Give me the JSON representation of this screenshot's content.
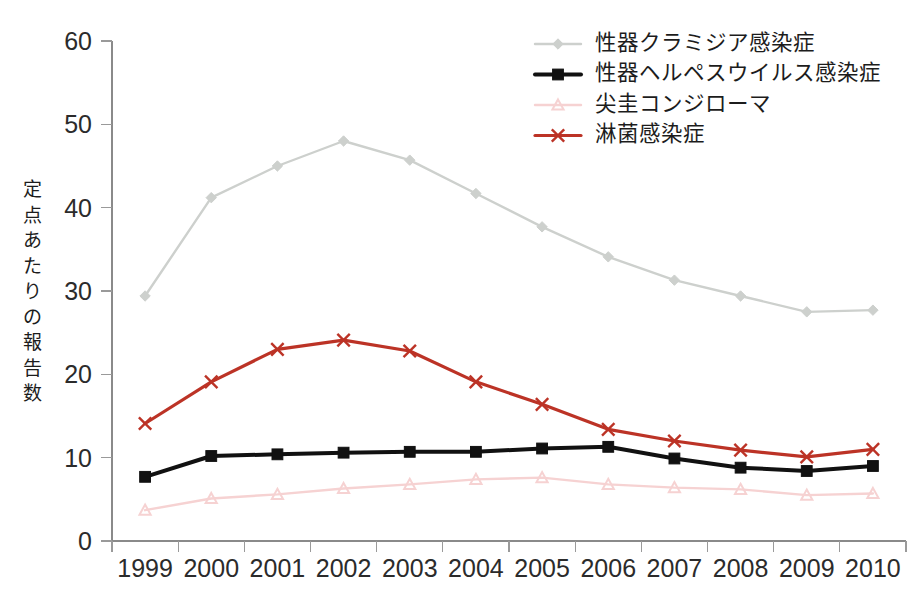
{
  "chart_data": {
    "type": "line",
    "title": "",
    "xlabel": "",
    "ylabel": "定点あたりの報告数",
    "categories": [
      "1999",
      "2000",
      "2001",
      "2002",
      "2003",
      "2004",
      "2005",
      "2006",
      "2007",
      "2008",
      "2009",
      "2010"
    ],
    "ylim": [
      0,
      60
    ],
    "y_ticks": [
      "0",
      "10",
      "20",
      "30",
      "40",
      "50",
      "60"
    ],
    "grid": false,
    "legend_position": "top-right",
    "series": [
      {
        "name": "性器クラミジア感染症",
        "color": "#cdd0cd",
        "marker": "diamond",
        "values": [
          29.4,
          41.2,
          45.0,
          48.0,
          45.7,
          41.7,
          37.7,
          34.1,
          31.3,
          29.4,
          27.5,
          27.7
        ]
      },
      {
        "name": "性器ヘルペスウイルス感染症",
        "color": "#111111",
        "marker": "square",
        "values": [
          7.7,
          10.2,
          10.4,
          10.6,
          10.7,
          10.7,
          11.1,
          11.3,
          9.9,
          8.8,
          8.4,
          9.0
        ]
      },
      {
        "name": "尖圭コンジローマ",
        "color": "#f6d2d2",
        "marker": "triangle",
        "values": [
          3.7,
          5.1,
          5.6,
          6.3,
          6.8,
          7.4,
          7.6,
          6.8,
          6.4,
          6.2,
          5.5,
          5.7
        ]
      },
      {
        "name": "淋菌感染症",
        "color": "#bc3326",
        "marker": "cross",
        "values": [
          14.1,
          19.1,
          23.0,
          24.1,
          22.8,
          19.1,
          16.4,
          13.4,
          12.0,
          10.9,
          10.1,
          11.0
        ]
      }
    ]
  },
  "axes": {
    "y_axis_label": "定点あたりの報告数",
    "y_tick_labels": [
      "60",
      "50",
      "40",
      "30",
      "20",
      "10",
      "0"
    ],
    "x_tick_labels": [
      "1999",
      "2000",
      "2001",
      "2002",
      "2003",
      "2004",
      "2005",
      "2006",
      "2007",
      "2008",
      "2009",
      "2010"
    ]
  },
  "legend": {
    "items": [
      {
        "label": "性器クラミジア感染症",
        "color": "#cdd0cd",
        "marker": "diamond"
      },
      {
        "label": "性器ヘルペスウイルス感染症",
        "color": "#111111",
        "marker": "square"
      },
      {
        "label": "尖圭コンジローマ",
        "color": "#f6d2d2",
        "marker": "triangle"
      },
      {
        "label": "淋菌感染症",
        "color": "#bc3326",
        "marker": "cross"
      }
    ]
  },
  "colors": {
    "axis": "#8a8a8a",
    "text": "#1c1c1c",
    "background": "#ffffff",
    "series_chlamydia": "#cdd0cd",
    "series_herpes": "#111111",
    "series_condyloma": "#f6d2d2",
    "series_gonorrhea": "#bc3326"
  }
}
